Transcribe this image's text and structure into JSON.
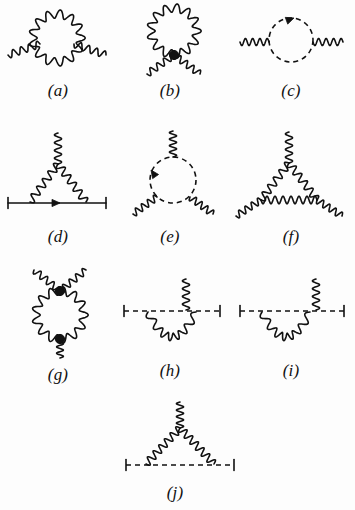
{
  "figure": {
    "background_color": "#fdfdfd",
    "ink_color": "#111111",
    "width": 355,
    "height": 510,
    "line_styles": {
      "wavy": "gauge-boson",
      "dashed": "scalar",
      "solid": "fermion"
    }
  },
  "diagrams": [
    {
      "id": "a",
      "label": "(a)",
      "caption_position": {
        "x": 8,
        "y": 82,
        "w": 100
      },
      "box": {
        "x": 4,
        "y": 2,
        "w": 108,
        "h": 78
      },
      "description": "wavy self-energy loop with two wavy external legs",
      "loop": {
        "type": "wavy",
        "shape": "circle",
        "cx": 57,
        "cy": 38,
        "r": 24,
        "cycles": 13,
        "amp": 4.2
      },
      "legs": [
        {
          "type": "wavy",
          "x1": 8,
          "y1": 55,
          "x2": 40,
          "y2": 44,
          "cycles": 4,
          "amp": 3.6
        },
        {
          "type": "wavy",
          "x1": 74,
          "y1": 44,
          "x2": 106,
          "y2": 55,
          "cycles": 4,
          "amp": 3.6
        }
      ],
      "ticks": [],
      "dots": [],
      "arrows": []
    },
    {
      "id": "b",
      "label": "(b)",
      "caption_position": {
        "x": 120,
        "y": 82,
        "w": 100
      },
      "box": {
        "x": 118,
        "y": 2,
        "w": 108,
        "h": 78
      },
      "description": "wavy tadpole loop joined at a filled vertex with two downward wavy legs",
      "loop": {
        "type": "wavy",
        "shape": "circle",
        "cx": 174,
        "cy": 31,
        "r": 23,
        "cycles": 13,
        "amp": 4.2
      },
      "legs": [
        {
          "type": "wavy",
          "x1": 174,
          "y1": 55,
          "x2": 147,
          "y2": 74,
          "cycles": 4,
          "amp": 3.4
        },
        {
          "type": "wavy",
          "x1": 174,
          "y1": 55,
          "x2": 200,
          "y2": 74,
          "cycles": 4,
          "amp": 3.4
        }
      ],
      "ticks": [],
      "dots": [
        {
          "cx": 174,
          "cy": 55,
          "r": 4.6
        }
      ],
      "arrows": []
    },
    {
      "id": "c",
      "label": "(c)",
      "caption_position": {
        "x": 236,
        "y": 82,
        "w": 110
      },
      "box": {
        "x": 232,
        "y": 2,
        "w": 118,
        "h": 78
      },
      "description": "dashed scalar loop with clockwise arrow and two wavy external legs",
      "loop": {
        "type": "dashed",
        "shape": "circle",
        "cx": 291,
        "cy": 40,
        "r": 22
      },
      "legs": [
        {
          "type": "wavy",
          "x1": 240,
          "y1": 42,
          "x2": 269,
          "y2": 42,
          "cycles": 4,
          "amp": 3.6
        },
        {
          "type": "wavy",
          "x1": 313,
          "y1": 42,
          "x2": 343,
          "y2": 42,
          "cycles": 4,
          "amp": 3.6
        }
      ],
      "ticks": [],
      "dots": [],
      "arrows": [
        {
          "x": 294,
          "y": 18,
          "angle": -20
        }
      ]
    },
    {
      "id": "d",
      "label": "(d)",
      "caption_position": {
        "x": 8,
        "y": 228,
        "w": 100
      },
      "box": {
        "x": 4,
        "y": 126,
        "w": 108,
        "h": 96
      },
      "description": "fermion line with vertex correction: wavy triangle above solid arrowed line, wavy leg up",
      "loop": null,
      "legs": [
        {
          "type": "solid",
          "x1": 8,
          "y1": 203,
          "x2": 106,
          "y2": 203
        },
        {
          "type": "wavy",
          "x1": 30,
          "y1": 202,
          "x2": 58,
          "y2": 164,
          "cycles": 5,
          "amp": 3.8
        },
        {
          "type": "wavy",
          "x1": 58,
          "y1": 164,
          "x2": 86,
          "y2": 202,
          "cycles": 5,
          "amp": 3.8
        },
        {
          "type": "wavy",
          "x1": 58,
          "y1": 164,
          "x2": 58,
          "y2": 133,
          "cycles": 4,
          "amp": 3.6
        }
      ],
      "ticks": [
        {
          "x": 8,
          "y": 203,
          "h": 11
        },
        {
          "x": 106,
          "y": 203,
          "h": 11
        }
      ],
      "dots": [],
      "arrows": [
        {
          "x": 60,
          "y": 203,
          "angle": 0
        }
      ]
    },
    {
      "id": "e",
      "label": "(e)",
      "caption_position": {
        "x": 120,
        "y": 228,
        "w": 100
      },
      "box": {
        "x": 118,
        "y": 126,
        "w": 108,
        "h": 96
      },
      "description": "dashed loop with arrow, one wavy leg up and two wavy legs down",
      "loop": {
        "type": "dashed",
        "shape": "circle",
        "cx": 173,
        "cy": 180,
        "r": 23
      },
      "legs": [
        {
          "type": "wavy",
          "x1": 173,
          "y1": 157,
          "x2": 173,
          "y2": 131,
          "cycles": 4,
          "amp": 3.6
        },
        {
          "type": "wavy",
          "x1": 157,
          "y1": 197,
          "x2": 133,
          "y2": 214,
          "cycles": 4,
          "amp": 3.4
        },
        {
          "type": "wavy",
          "x1": 190,
          "y1": 197,
          "x2": 213,
          "y2": 214,
          "cycles": 4,
          "amp": 3.4
        }
      ],
      "ticks": [],
      "dots": [],
      "arrows": [
        {
          "x": 151,
          "y": 170,
          "angle": 235
        }
      ]
    },
    {
      "id": "f",
      "label": "(f)",
      "caption_position": {
        "x": 236,
        "y": 228,
        "w": 110
      },
      "box": {
        "x": 232,
        "y": 126,
        "w": 118,
        "h": 96
      },
      "description": "pure wavy triangle loop with three wavy external legs",
      "loop": null,
      "legs": [
        {
          "type": "wavy",
          "x1": 261,
          "y1": 200,
          "x2": 289,
          "y2": 163,
          "cycles": 5,
          "amp": 3.8
        },
        {
          "type": "wavy",
          "x1": 289,
          "y1": 163,
          "x2": 317,
          "y2": 200,
          "cycles": 5,
          "amp": 3.8
        },
        {
          "type": "wavy",
          "x1": 261,
          "y1": 200,
          "x2": 317,
          "y2": 200,
          "cycles": 7,
          "amp": 3.8
        },
        {
          "type": "wavy",
          "x1": 289,
          "y1": 163,
          "x2": 289,
          "y2": 132,
          "cycles": 4,
          "amp": 3.6
        },
        {
          "type": "wavy",
          "x1": 261,
          "y1": 200,
          "x2": 236,
          "y2": 216,
          "cycles": 4,
          "amp": 3.4
        },
        {
          "type": "wavy",
          "x1": 317,
          "y1": 200,
          "x2": 342,
          "y2": 216,
          "cycles": 4,
          "amp": 3.4
        }
      ],
      "ticks": [],
      "dots": [],
      "arrows": []
    },
    {
      "id": "g",
      "label": "(g)",
      "caption_position": {
        "x": 8,
        "y": 366,
        "w": 100
      },
      "box": {
        "x": 4,
        "y": 262,
        "w": 108,
        "h": 102
      },
      "description": "wavy loop with two filled vertices, two wavy legs up and one wavy leg down",
      "loop": {
        "type": "wavy",
        "shape": "circle",
        "cx": 60,
        "cy": 315,
        "r": 24,
        "cycles": 13,
        "amp": 4.2
      },
      "legs": [
        {
          "type": "wavy",
          "x1": 60,
          "y1": 291,
          "x2": 34,
          "y2": 270,
          "cycles": 4,
          "amp": 3.4
        },
        {
          "type": "wavy",
          "x1": 60,
          "y1": 291,
          "x2": 86,
          "y2": 270,
          "cycles": 4,
          "amp": 3.4
        },
        {
          "type": "wavy",
          "x1": 60,
          "y1": 339,
          "x2": 60,
          "y2": 358,
          "cycles": 3,
          "amp": 3.4
        }
      ],
      "ticks": [],
      "dots": [
        {
          "cx": 60,
          "cy": 291,
          "r": 4.6
        },
        {
          "cx": 60,
          "cy": 339,
          "r": 4.6
        }
      ],
      "arrows": []
    },
    {
      "id": "h",
      "label": "(h)",
      "caption_position": {
        "x": 120,
        "y": 362,
        "w": 100
      },
      "box": {
        "x": 118,
        "y": 272,
        "w": 108,
        "h": 86
      },
      "description": "dashed line with end ticks, wavy arc below and wavy leg up from right vertex",
      "loop": null,
      "legs": [
        {
          "type": "dashed",
          "x1": 124,
          "y1": 311,
          "x2": 220,
          "y2": 311
        },
        {
          "type": "wavy-arc",
          "x1": 148,
          "y1": 312,
          "x2": 196,
          "y2": 312,
          "sag": 25,
          "cycles": 7,
          "amp": 3.8
        },
        {
          "type": "wavy",
          "x1": 186,
          "y1": 310,
          "x2": 186,
          "y2": 279,
          "cycles": 4,
          "amp": 3.6
        }
      ],
      "ticks": [
        {
          "x": 124,
          "y": 311,
          "h": 11
        },
        {
          "x": 220,
          "y": 311,
          "h": 11
        }
      ],
      "dots": [],
      "arrows": []
    },
    {
      "id": "i",
      "label": "(i)",
      "caption_position": {
        "x": 236,
        "y": 362,
        "w": 110
      },
      "box": {
        "x": 232,
        "y": 272,
        "w": 118,
        "h": 86
      },
      "description": "dashed line with end ticks, wavy arc below and wavy leg up near the right end",
      "loop": null,
      "legs": [
        {
          "type": "dashed",
          "x1": 240,
          "y1": 311,
          "x2": 344,
          "y2": 311
        },
        {
          "type": "wavy-arc",
          "x1": 262,
          "y1": 312,
          "x2": 310,
          "y2": 312,
          "sag": 25,
          "cycles": 7,
          "amp": 3.8
        },
        {
          "type": "wavy",
          "x1": 316,
          "y1": 310,
          "x2": 316,
          "y2": 279,
          "cycles": 4,
          "amp": 3.6
        }
      ],
      "ticks": [
        {
          "x": 240,
          "y": 311,
          "h": 11
        },
        {
          "x": 344,
          "y": 311,
          "h": 11
        }
      ],
      "dots": [],
      "arrows": []
    },
    {
      "id": "j",
      "label": "(j)",
      "caption_position": {
        "x": 120,
        "y": 484,
        "w": 110
      },
      "box": {
        "x": 116,
        "y": 398,
        "w": 124,
        "h": 86
      },
      "description": "dashed line with end ticks, wavy triangle above and wavy leg going up",
      "loop": null,
      "legs": [
        {
          "type": "dashed",
          "x1": 126,
          "y1": 465,
          "x2": 234,
          "y2": 465
        },
        {
          "type": "wavy",
          "x1": 146,
          "y1": 464,
          "x2": 180,
          "y2": 428,
          "cycles": 6,
          "amp": 3.8
        },
        {
          "type": "wavy",
          "x1": 180,
          "y1": 428,
          "x2": 214,
          "y2": 464,
          "cycles": 6,
          "amp": 3.8
        },
        {
          "type": "wavy",
          "x1": 180,
          "y1": 428,
          "x2": 180,
          "y2": 402,
          "cycles": 4,
          "amp": 3.6
        }
      ],
      "ticks": [
        {
          "x": 126,
          "y": 465,
          "h": 11
        },
        {
          "x": 234,
          "y": 465,
          "h": 11
        }
      ],
      "dots": [],
      "arrows": []
    }
  ]
}
